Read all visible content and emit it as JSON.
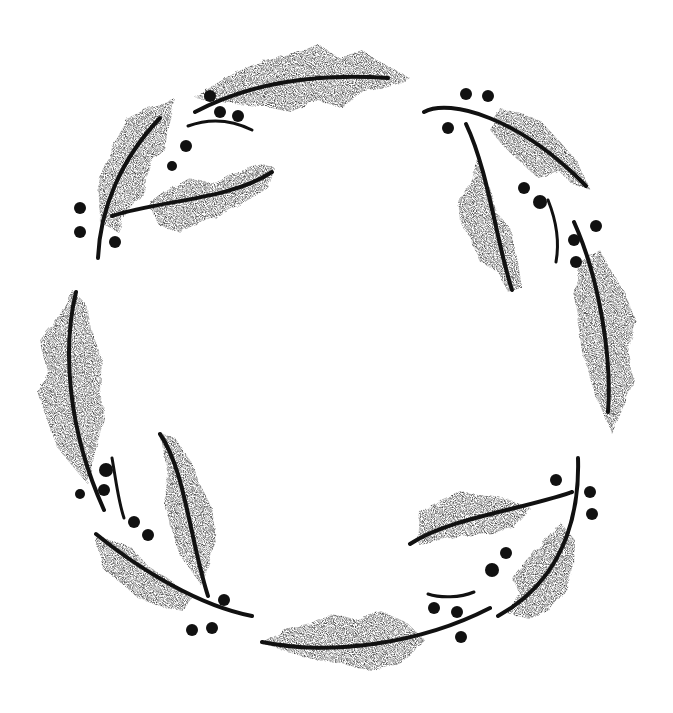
{
  "image": {
    "subject": "holly wreath",
    "style": "black and white stippled ink illustration",
    "width": 673,
    "height": 713,
    "background": "#ffffff",
    "ink": "#111111",
    "leaf_tone": "#4a4a4a"
  },
  "leaves": [
    {
      "name": "top-leaf",
      "d": "M195,98 C230,72 270,55 300,52 L318,44 L340,58 L362,50 L380,62 L410,78 L392,86 L365,92 L340,108 L318,100 L290,112 L262,106 L235,104 Z",
      "rib": "M195,112 C240,88 300,72 388,78"
    },
    {
      "name": "top-left-upper-leaf",
      "d": "M98,180 L112,148 L128,118 L148,108 L175,98 L168,126 L165,150 L150,162 L145,192 L128,210 L118,232 L100,222 Z",
      "rib": "M98,258 C100,210 120,160 160,118"
    },
    {
      "name": "top-left-lower-leaf",
      "d": "M148,205 L168,190 L190,178 L215,183 L238,172 L262,164 L275,168 L268,188 L248,200 L226,212 L200,222 L180,232 L160,226 Z",
      "rib": "M112,216 C160,200 230,200 272,172"
    },
    {
      "name": "top-right-leaf",
      "d": "M500,108 L522,114 L540,120 L560,142 L578,162 L590,190 L572,184 L560,172 L538,178 L518,160 L505,148 L490,130 Z",
      "rib": "M424,112 C450,98 520,118 586,186"
    },
    {
      "name": "right-upper-leaf",
      "d": "M478,160 L490,188 L498,214 L510,228 L518,262 L522,288 L508,292 L498,272 L480,262 L470,238 L460,222 L458,198 L470,186 Z",
      "rib": "M466,124 C488,170 496,240 512,290"
    },
    {
      "name": "right-lower-leaf",
      "d": "M580,262 L600,250 L612,272 L625,292 L636,322 L628,352 L634,380 L624,406 L612,434 L598,402 L590,376 L582,352 L578,322 L574,296 Z",
      "rib": "M574,222 C600,280 612,360 608,412"
    },
    {
      "name": "left-leaf",
      "d": "M72,290 L58,318 L40,340 L48,372 L38,392 L46,418 L58,448 L74,468 L88,484 L96,448 L104,418 L100,390 L102,360 L92,330 L86,304 Z",
      "rib": "M76,292 C62,350 68,430 104,510"
    },
    {
      "name": "bottom-left-upper-leaf",
      "d": "M160,432 L175,438 L190,460 L200,484 L212,508 L216,540 L210,560 L202,586 L192,572 L180,556 L172,530 L164,504 L168,476 Z",
      "rib": "M160,434 C185,470 190,540 208,596"
    },
    {
      "name": "bottom-left-lower-leaf",
      "d": "M94,536 L112,540 L132,548 L148,566 L170,580 L192,598 L182,610 L158,606 L138,598 L120,582 L104,570 Z",
      "rib": "M96,534 C140,570 200,606 252,616"
    },
    {
      "name": "bottom-right-upper-leaf",
      "d": "M420,512 L440,500 L462,492 L494,496 L510,500 L530,508 L512,528 L488,534 L460,536 L440,540 L418,544 Z",
      "rib": "M410,544 C450,518 520,510 572,492"
    },
    {
      "name": "bottom-right-lower-leaf",
      "d": "M560,522 L575,540 L574,566 L566,590 L550,610 L530,620 L508,614 L520,594 L512,578 L526,560 L540,546 Z",
      "rib": "M578,458 C580,520 560,582 498,616"
    },
    {
      "name": "bottom-leaf",
      "d": "M262,644 L285,630 L312,624 L332,614 L355,620 L380,610 L408,624 L425,640 L410,658 L395,666 L370,670 L342,664 L318,660 L290,652 Z",
      "rib": "M262,642 C330,656 420,644 490,608"
    }
  ],
  "stems": [
    {
      "name": "top-small-stem",
      "d": "M188,126 C210,118 232,120 252,130"
    },
    {
      "name": "right-small-stem",
      "d": "M548,200 C556,220 560,240 556,262"
    },
    {
      "name": "left-small-stem",
      "d": "M112,458 C116,480 118,500 124,518"
    },
    {
      "name": "bottom-small-stem",
      "d": "M428,594 C440,598 460,598 474,592"
    }
  ],
  "berries": [
    {
      "cx": 210,
      "cy": 96,
      "r": 6
    },
    {
      "cx": 220,
      "cy": 112,
      "r": 6
    },
    {
      "cx": 238,
      "cy": 116,
      "r": 6
    },
    {
      "cx": 186,
      "cy": 146,
      "r": 6
    },
    {
      "cx": 172,
      "cy": 166,
      "r": 5
    },
    {
      "cx": 80,
      "cy": 208,
      "r": 6
    },
    {
      "cx": 80,
      "cy": 232,
      "r": 6
    },
    {
      "cx": 115,
      "cy": 242,
      "r": 6
    },
    {
      "cx": 466,
      "cy": 94,
      "r": 6
    },
    {
      "cx": 488,
      "cy": 96,
      "r": 6
    },
    {
      "cx": 448,
      "cy": 128,
      "r": 6
    },
    {
      "cx": 524,
      "cy": 188,
      "r": 6
    },
    {
      "cx": 540,
      "cy": 202,
      "r": 7
    },
    {
      "cx": 596,
      "cy": 226,
      "r": 6
    },
    {
      "cx": 574,
      "cy": 240,
      "r": 6
    },
    {
      "cx": 576,
      "cy": 262,
      "r": 6
    },
    {
      "cx": 106,
      "cy": 470,
      "r": 7
    },
    {
      "cx": 104,
      "cy": 490,
      "r": 6
    },
    {
      "cx": 80,
      "cy": 494,
      "r": 5
    },
    {
      "cx": 134,
      "cy": 522,
      "r": 6
    },
    {
      "cx": 148,
      "cy": 535,
      "r": 6
    },
    {
      "cx": 224,
      "cy": 600,
      "r": 6
    },
    {
      "cx": 192,
      "cy": 630,
      "r": 6
    },
    {
      "cx": 212,
      "cy": 628,
      "r": 6
    },
    {
      "cx": 556,
      "cy": 480,
      "r": 6
    },
    {
      "cx": 590,
      "cy": 492,
      "r": 6
    },
    {
      "cx": 592,
      "cy": 514,
      "r": 6
    },
    {
      "cx": 506,
      "cy": 553,
      "r": 6
    },
    {
      "cx": 492,
      "cy": 570,
      "r": 7
    },
    {
      "cx": 434,
      "cy": 608,
      "r": 6
    },
    {
      "cx": 457,
      "cy": 612,
      "r": 6
    },
    {
      "cx": 461,
      "cy": 637,
      "r": 6
    }
  ]
}
